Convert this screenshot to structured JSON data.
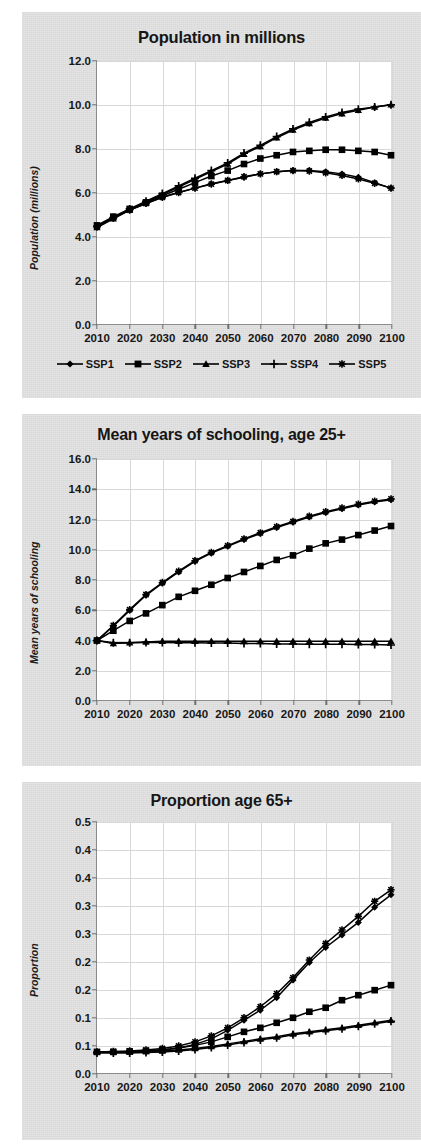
{
  "figure": {
    "background_color": "#e2e2e2",
    "plot_background_color": "#ffffff",
    "series_color": "#000000",
    "grid_color": "#d8d8d8"
  },
  "legend": {
    "position": "below-chart-1",
    "items": [
      {
        "label": "SSP1",
        "marker": "diamond-marker"
      },
      {
        "label": "SSP2",
        "marker": "square-marker"
      },
      {
        "label": "SSP3",
        "marker": "triangle-marker"
      },
      {
        "label": "SSP4",
        "marker": "plus-marker"
      },
      {
        "label": "SSP5",
        "marker": "asterisk-marker"
      }
    ]
  },
  "chart_data": [
    {
      "id": "population",
      "type": "line",
      "title": "Population in millions",
      "xlabel": "",
      "ylabel": "Population (millions)",
      "xlim": [
        2010,
        2100
      ],
      "ylim": [
        0.0,
        12.0
      ],
      "ytick_step": 2.0,
      "grid": true,
      "legend": "bottom",
      "xticks": [
        2010,
        2020,
        2030,
        2040,
        2050,
        2060,
        2070,
        2080,
        2090,
        2100
      ],
      "yticks": [
        "0.0",
        "2.0",
        "4.0",
        "6.0",
        "8.0",
        "10.0",
        "12.0"
      ],
      "x": [
        2010,
        2015,
        2020,
        2025,
        2030,
        2035,
        2040,
        2045,
        2050,
        2055,
        2060,
        2065,
        2070,
        2075,
        2080,
        2085,
        2090,
        2095,
        2100
      ],
      "series": [
        {
          "name": "SSP1",
          "marker": "diamond-marker",
          "values": [
            4.45,
            4.85,
            5.2,
            5.5,
            5.78,
            6.0,
            6.2,
            6.4,
            6.55,
            6.7,
            6.85,
            6.95,
            7.0,
            7.0,
            6.95,
            6.85,
            6.7,
            6.45,
            6.2
          ]
        },
        {
          "name": "SSP2",
          "marker": "square-marker",
          "values": [
            4.5,
            4.9,
            5.25,
            5.55,
            5.85,
            6.15,
            6.45,
            6.75,
            7.0,
            7.3,
            7.55,
            7.7,
            7.85,
            7.9,
            7.95,
            7.95,
            7.9,
            7.85,
            7.7
          ]
        },
        {
          "name": "SSP3",
          "marker": "triangle-marker",
          "values": [
            4.4,
            4.8,
            5.2,
            5.55,
            5.9,
            6.25,
            6.6,
            6.95,
            7.3,
            7.75,
            8.1,
            8.5,
            8.85,
            9.15,
            9.4,
            9.6,
            9.75,
            9.9,
            10.0
          ]
        },
        {
          "name": "SSP4",
          "marker": "plus-marker",
          "values": [
            4.45,
            4.85,
            5.25,
            5.6,
            5.95,
            6.3,
            6.65,
            7.0,
            7.35,
            7.8,
            8.15,
            8.55,
            8.9,
            9.2,
            9.45,
            9.65,
            9.8,
            9.9,
            10.0
          ]
        },
        {
          "name": "SSP5",
          "marker": "asterisk-marker",
          "values": [
            4.45,
            4.85,
            5.2,
            5.5,
            5.78,
            6.0,
            6.2,
            6.38,
            6.55,
            6.72,
            6.85,
            6.95,
            7.0,
            6.98,
            6.9,
            6.78,
            6.62,
            6.42,
            6.2
          ]
        }
      ]
    },
    {
      "id": "schooling",
      "type": "line",
      "title": "Mean years of schooling, age 25+",
      "xlabel": "",
      "ylabel": "Mean years of schooling",
      "xlim": [
        2010,
        2100
      ],
      "ylim": [
        0.0,
        16.0
      ],
      "ytick_step": 2.0,
      "grid": true,
      "legend": "none",
      "xticks": [
        2010,
        2020,
        2030,
        2040,
        2050,
        2060,
        2070,
        2080,
        2090,
        2100
      ],
      "yticks": [
        "0.0",
        "2.0",
        "4.0",
        "6.0",
        "8.0",
        "10.0",
        "12.0",
        "14.0",
        "16.0"
      ],
      "x": [
        2010,
        2015,
        2020,
        2025,
        2030,
        2035,
        2040,
        2045,
        2050,
        2055,
        2060,
        2065,
        2070,
        2075,
        2080,
        2085,
        2090,
        2095,
        2100
      ],
      "series": [
        {
          "name": "SSP1",
          "marker": "diamond-marker",
          "values": [
            3.95,
            4.9,
            5.95,
            6.95,
            7.75,
            8.5,
            9.2,
            9.75,
            10.2,
            10.65,
            11.05,
            11.45,
            11.8,
            12.15,
            12.45,
            12.7,
            12.95,
            13.15,
            13.3
          ]
        },
        {
          "name": "SSP2",
          "marker": "square-marker",
          "values": [
            3.95,
            4.6,
            5.25,
            5.75,
            6.3,
            6.85,
            7.25,
            7.65,
            8.1,
            8.5,
            8.9,
            9.3,
            9.6,
            10.05,
            10.4,
            10.65,
            10.95,
            11.25,
            11.55
          ]
        },
        {
          "name": "SSP3",
          "marker": "triangle-marker",
          "values": [
            3.95,
            3.75,
            3.8,
            3.85,
            3.9,
            3.9,
            3.9,
            3.9,
            3.9,
            3.9,
            3.9,
            3.9,
            3.9,
            3.9,
            3.9,
            3.9,
            3.9,
            3.9,
            3.9
          ]
        },
        {
          "name": "SSP4",
          "marker": "plus-marker",
          "values": [
            3.95,
            3.8,
            3.8,
            3.82,
            3.82,
            3.8,
            3.8,
            3.78,
            3.78,
            3.75,
            3.75,
            3.72,
            3.72,
            3.7,
            3.7,
            3.7,
            3.68,
            3.68,
            3.65
          ]
        },
        {
          "name": "SSP5",
          "marker": "asterisk-marker",
          "values": [
            3.95,
            4.95,
            6.0,
            7.0,
            7.8,
            8.55,
            9.25,
            9.8,
            10.25,
            10.7,
            11.1,
            11.5,
            11.85,
            12.2,
            12.5,
            12.75,
            13.0,
            13.2,
            13.35
          ]
        }
      ]
    },
    {
      "id": "proportion65",
      "type": "line",
      "title": "Proportion age 65+",
      "xlabel": "",
      "ylabel": "Proportion",
      "xlim": [
        2010,
        2100
      ],
      "ylim": [
        0.0,
        0.5
      ],
      "ytick_step": 0.05,
      "grid": true,
      "legend": "none",
      "xticks": [
        2010,
        2020,
        2030,
        2040,
        2050,
        2060,
        2070,
        2080,
        2090,
        2100
      ],
      "yticks": [
        "0.0",
        "0.1",
        "0.1",
        "0.2",
        "0.2",
        "0.3",
        "0.3",
        "0.4",
        "0.4",
        "0.5"
      ],
      "x": [
        2010,
        2015,
        2020,
        2025,
        2030,
        2035,
        2040,
        2045,
        2050,
        2055,
        2060,
        2065,
        2070,
        2075,
        2080,
        2085,
        2090,
        2095,
        2100
      ],
      "series": [
        {
          "name": "SSP1",
          "marker": "diamond-marker",
          "values": [
            0.042,
            0.042,
            0.043,
            0.044,
            0.046,
            0.05,
            0.057,
            0.068,
            0.085,
            0.105,
            0.125,
            0.15,
            0.185,
            0.22,
            0.25,
            0.275,
            0.3,
            0.33,
            0.355
          ]
        },
        {
          "name": "SSP2",
          "marker": "square-marker",
          "values": [
            0.042,
            0.042,
            0.043,
            0.044,
            0.046,
            0.05,
            0.055,
            0.062,
            0.072,
            0.082,
            0.09,
            0.1,
            0.11,
            0.122,
            0.13,
            0.145,
            0.155,
            0.165,
            0.175
          ]
        },
        {
          "name": "SSP3",
          "marker": "triangle-marker",
          "values": [
            0.042,
            0.042,
            0.042,
            0.043,
            0.044,
            0.046,
            0.049,
            0.053,
            0.058,
            0.063,
            0.068,
            0.072,
            0.078,
            0.082,
            0.086,
            0.09,
            0.095,
            0.1,
            0.105
          ]
        },
        {
          "name": "SSP4",
          "marker": "plus-marker",
          "values": [
            0.04,
            0.04,
            0.04,
            0.041,
            0.042,
            0.044,
            0.047,
            0.051,
            0.056,
            0.061,
            0.066,
            0.07,
            0.076,
            0.08,
            0.084,
            0.088,
            0.093,
            0.098,
            0.103
          ]
        },
        {
          "name": "SSP5",
          "marker": "asterisk-marker",
          "values": [
            0.042,
            0.043,
            0.044,
            0.046,
            0.049,
            0.054,
            0.062,
            0.074,
            0.09,
            0.11,
            0.132,
            0.158,
            0.19,
            0.225,
            0.258,
            0.285,
            0.312,
            0.342,
            0.365
          ]
        }
      ]
    }
  ]
}
